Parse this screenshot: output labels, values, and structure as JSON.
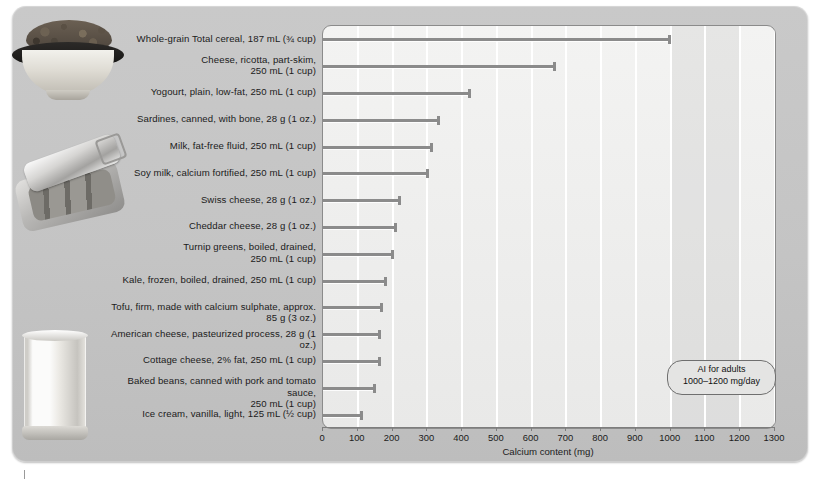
{
  "chart_data": {
    "type": "bar",
    "orientation": "horizontal",
    "title": "",
    "xlabel": "Calcium content (mg)",
    "ylabel": "",
    "xlim": [
      0,
      1300
    ],
    "xticks": [
      0,
      100,
      200,
      300,
      400,
      500,
      600,
      700,
      800,
      900,
      1000,
      1100,
      1200,
      1300
    ],
    "grid": true,
    "legend": null,
    "categories": [
      "Whole-grain Total cereal, 187 mL (¾ cup)",
      "Cheese, ricotta, part-skim, 250 mL (1 cup)",
      "Yogourt, plain, low-fat, 250 mL (1 cup)",
      "Sardines, canned, with bone, 28 g (1 oz.)",
      "Milk, fat-free fluid, 250 mL (1 cup)",
      "Soy milk, calcium fortified, 250 mL (1 cup)",
      "Swiss cheese, 28 g (1 oz.)",
      "Cheddar cheese, 28 g (1 oz.)",
      "Turnip greens, boiled, drained, 250 mL (1 cup)",
      "Kale, frozen, boiled, drained, 250 mL (1 cup)",
      "Tofu, firm, made with calcium sulphate, approx. 85 g (3 oz.)",
      "American cheese, pasteurized process, 28 g (1 oz.)",
      "Cottage cheese, 2% fat, 250 mL (1 cup)",
      "Baked beans, canned with pork and tomato sauce, 250 mL (1 cup)",
      "Ice cream, vanilla, light, 125 mL (½ cup)"
    ],
    "values": [
      1000,
      669,
      425,
      336,
      316,
      304,
      224,
      214,
      204,
      184,
      172,
      168,
      166,
      152,
      116
    ],
    "annotations": [
      {
        "name": "ai-band",
        "line1": "AI for adults",
        "line2": "1000–1200 mg/day",
        "range": [
          1000,
          1200
        ]
      }
    ]
  },
  "labels": {
    "rows": [
      [
        "Whole-grain Total cereal, 187 mL (¾ cup)"
      ],
      [
        "Cheese, ricotta, part-skim,",
        "250 mL (1 cup)"
      ],
      [
        "Yogourt, plain, low-fat, 250 mL (1 cup)"
      ],
      [
        "Sardines, canned, with bone, 28 g (1 oz.)"
      ],
      [
        "Milk, fat-free fluid, 250 mL (1 cup)"
      ],
      [
        "Soy milk, calcium fortified, 250 mL (1 cup)"
      ],
      [
        "Swiss cheese, 28 g (1 oz.)"
      ],
      [
        "Cheddar cheese, 28 g (1 oz.)"
      ],
      [
        "Turnip greens, boiled, drained,",
        "250 mL (1 cup)"
      ],
      [
        "Kale, frozen, boiled, drained, 250 mL (1 cup)"
      ],
      [
        "Tofu, firm, made with calcium sulphate, approx. 85 g (3 oz.)"
      ],
      [
        "American cheese, pasteurized process, 28 g (1 oz.)"
      ],
      [
        "Cottage cheese, 2% fat, 250 mL (1 cup)"
      ],
      [
        "Baked beans, canned with pork and tomato sauce,",
        "250 mL (1 cup)"
      ],
      [
        "Ice cream, vanilla, light, 125 mL (½ cup)"
      ]
    ]
  },
  "axis": {
    "title": "Calcium content (mg)",
    "ticks": [
      "0",
      "100",
      "200",
      "300",
      "400",
      "500",
      "600",
      "700",
      "800",
      "900",
      "1000",
      "1100",
      "1200",
      "1300"
    ]
  },
  "callout": {
    "line1": "AI for adults",
    "line2": "1000–1200 mg/day"
  },
  "photos": [
    {
      "name": "cereal-bowl-photo"
    },
    {
      "name": "sardine-can-photo"
    },
    {
      "name": "milk-glass-photo"
    }
  ],
  "colors": {
    "panel": "#c4c4c4",
    "plot_bg": "#efefee",
    "bar": "#8b8b8b",
    "grid": "#ffffff",
    "text": "#1b1b1b",
    "band": "#a8a8a8"
  }
}
